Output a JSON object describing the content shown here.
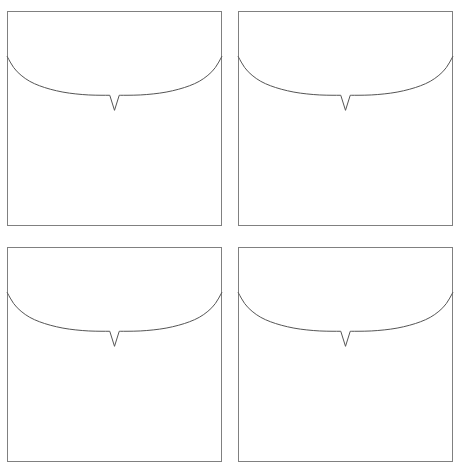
{
  "figure": {
    "background_color": "#ffffff",
    "width": 461,
    "height": 467,
    "panel_count": 4,
    "grid_rows": 2,
    "grid_cols": 2,
    "border_color": "#808080",
    "curve_color": "#555555",
    "curve_width": 1,
    "border_width": 1
  },
  "chart_data": {
    "type": "line",
    "title": "",
    "xlabel": "",
    "ylabel": "",
    "grid": false,
    "legend": false,
    "xlim": [
      0,
      1
    ],
    "ylim": [
      0,
      1
    ],
    "axis_ticks_visible": false,
    "axis_labels_visible": false,
    "shared_series_description": "Downward-bowing arc spanning the full panel width with a narrow downward V-notch spike at center",
    "panels": [
      {
        "id": "panel-top-left",
        "row": 0,
        "col": 0,
        "x": 7,
        "y": 11,
        "width": 215,
        "height": 215,
        "series": [
          {
            "name": "curve",
            "color": "#555555",
            "x": [
              0.0,
              0.03,
              0.065,
              0.105,
              0.15,
              0.2,
              0.26,
              0.32,
              0.38,
              0.44,
              0.478,
              0.482,
              0.5,
              0.518,
              0.522,
              0.56,
              0.62,
              0.68,
              0.74,
              0.8,
              0.85,
              0.895,
              0.935,
              0.97,
              1.0
            ],
            "y": [
              0.21,
              0.265,
              0.3,
              0.328,
              0.348,
              0.364,
              0.378,
              0.386,
              0.391,
              0.392,
              0.392,
              0.462,
              0.462,
              0.392,
              0.392,
              0.392,
              0.391,
              0.386,
              0.378,
              0.364,
              0.348,
              0.328,
              0.3,
              0.265,
              0.21
            ]
          }
        ],
        "notch": {
          "center_x": 0.5,
          "top_y": 0.392,
          "tip_y": 0.462,
          "half_width": 0.022
        }
      },
      {
        "id": "panel-top-right",
        "row": 0,
        "col": 1,
        "x": 238,
        "y": 11,
        "width": 215,
        "height": 215,
        "series": [
          {
            "name": "curve",
            "color": "#555555",
            "x": [
              0.0,
              0.03,
              0.065,
              0.105,
              0.15,
              0.2,
              0.26,
              0.32,
              0.38,
              0.44,
              0.478,
              0.482,
              0.5,
              0.518,
              0.522,
              0.56,
              0.62,
              0.68,
              0.74,
              0.8,
              0.85,
              0.895,
              0.935,
              0.97,
              1.0
            ],
            "y": [
              0.21,
              0.265,
              0.3,
              0.328,
              0.348,
              0.364,
              0.378,
              0.386,
              0.391,
              0.392,
              0.392,
              0.462,
              0.462,
              0.392,
              0.392,
              0.392,
              0.391,
              0.386,
              0.378,
              0.364,
              0.348,
              0.328,
              0.3,
              0.265,
              0.21
            ]
          }
        ],
        "notch": {
          "center_x": 0.5,
          "top_y": 0.392,
          "tip_y": 0.462,
          "half_width": 0.022
        }
      },
      {
        "id": "panel-bottom-left",
        "row": 1,
        "col": 0,
        "x": 7,
        "y": 247,
        "width": 215,
        "height": 215,
        "series": [
          {
            "name": "curve",
            "color": "#555555",
            "x": [
              0.0,
              0.03,
              0.065,
              0.105,
              0.15,
              0.2,
              0.26,
              0.32,
              0.38,
              0.44,
              0.478,
              0.482,
              0.5,
              0.518,
              0.522,
              0.56,
              0.62,
              0.68,
              0.74,
              0.8,
              0.85,
              0.895,
              0.935,
              0.97,
              1.0
            ],
            "y": [
              0.21,
              0.265,
              0.3,
              0.328,
              0.348,
              0.364,
              0.378,
              0.386,
              0.391,
              0.392,
              0.392,
              0.462,
              0.462,
              0.392,
              0.392,
              0.392,
              0.391,
              0.386,
              0.378,
              0.364,
              0.348,
              0.328,
              0.3,
              0.265,
              0.21
            ]
          }
        ],
        "notch": {
          "center_x": 0.5,
          "top_y": 0.392,
          "tip_y": 0.462,
          "half_width": 0.022
        }
      },
      {
        "id": "panel-bottom-right",
        "row": 1,
        "col": 1,
        "x": 238,
        "y": 247,
        "width": 215,
        "height": 215,
        "series": [
          {
            "name": "curve",
            "color": "#555555",
            "x": [
              0.0,
              0.03,
              0.065,
              0.105,
              0.15,
              0.2,
              0.26,
              0.32,
              0.38,
              0.44,
              0.478,
              0.482,
              0.5,
              0.518,
              0.522,
              0.56,
              0.62,
              0.68,
              0.74,
              0.8,
              0.85,
              0.895,
              0.935,
              0.97,
              1.0
            ],
            "y": [
              0.21,
              0.265,
              0.3,
              0.328,
              0.348,
              0.364,
              0.378,
              0.386,
              0.391,
              0.392,
              0.392,
              0.462,
              0.462,
              0.392,
              0.392,
              0.392,
              0.391,
              0.386,
              0.378,
              0.364,
              0.348,
              0.328,
              0.3,
              0.265,
              0.21
            ]
          }
        ],
        "notch": {
          "center_x": 0.5,
          "top_y": 0.392,
          "tip_y": 0.462,
          "half_width": 0.022
        }
      }
    ]
  }
}
